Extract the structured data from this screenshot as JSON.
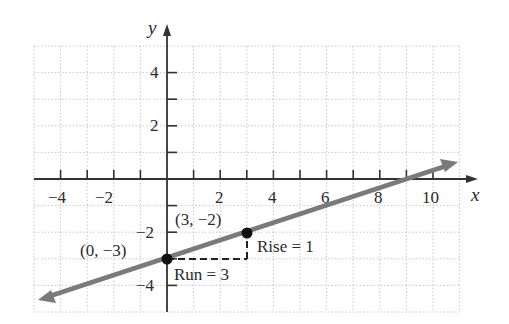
{
  "chart_data": {
    "type": "line",
    "title": "",
    "xlabel": "x",
    "ylabel": "y",
    "xlim": [
      -5,
      11
    ],
    "ylim": [
      -5,
      5
    ],
    "grid": true,
    "x_tick_labels": [
      "−4",
      "−2",
      "2",
      "4",
      "6",
      "8",
      "10"
    ],
    "x_tick_values": [
      -4,
      -2,
      2,
      4,
      6,
      8,
      10
    ],
    "y_tick_labels": [
      "4",
      "2",
      "−2",
      "−4"
    ],
    "y_tick_values": [
      4,
      2,
      -2,
      -4
    ],
    "series": [
      {
        "name": "line",
        "equation": "y = (1/3)x − 3",
        "slope": 0.3333,
        "intercept": -3,
        "x": [
          -4.7,
          11.0
        ],
        "y": [
          -4.57,
          0.67
        ],
        "color": "#7a7a7a"
      }
    ],
    "points": [
      {
        "x": 0,
        "y": -3,
        "label": "(0, −3)"
      },
      {
        "x": 3,
        "y": -2,
        "label": "(3, −2)"
      }
    ],
    "annotations": [
      {
        "text": "Run = 3",
        "from": [
          0,
          -3
        ],
        "to": [
          3,
          -3
        ],
        "style": "dashed"
      },
      {
        "text": "Rise = 1",
        "from": [
          3,
          -3
        ],
        "to": [
          3,
          -2
        ],
        "style": "dashed"
      }
    ]
  },
  "labels": {
    "x_axis": "x",
    "y_axis": "y",
    "point_a": "(0, −3)",
    "point_b": "(3, −2)",
    "run": "Run = 3",
    "rise": "Rise = 1",
    "xt_m4": "−4",
    "xt_m2": "−2",
    "xt_2": "2",
    "xt_4": "4",
    "xt_6": "6",
    "xt_8": "8",
    "xt_10": "10",
    "yt_4": "4",
    "yt_2": "2",
    "yt_m2": "−2",
    "yt_m4": "−4"
  },
  "colors": {
    "axis": "#333333",
    "grid": "#c8c8c8",
    "line": "#7a7a7a",
    "point": "#111111"
  }
}
